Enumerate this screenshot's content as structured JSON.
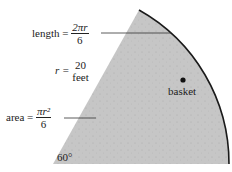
{
  "diagram": {
    "length_label": {
      "lhs": "length =",
      "num": "2πr",
      "den": "6"
    },
    "radius_label": {
      "lhs": "r =",
      "num": "20",
      "den": "feet"
    },
    "area_label": {
      "lhs": "area =",
      "num": "πr²",
      "den": "6"
    },
    "point_label": "basket",
    "angle_label": "60°",
    "colors": {
      "sector_fill": "#c4c4c4",
      "arc": "#1a1a1a",
      "text": "#222222"
    }
  }
}
